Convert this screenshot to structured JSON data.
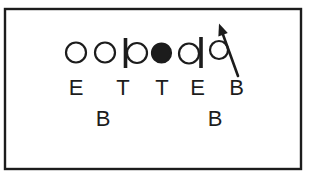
{
  "figure": {
    "kind": "football-play-diagram",
    "background_color": "#ffffff",
    "ink_color": "#1c1c1c",
    "frame": {
      "x": 5,
      "y": 9,
      "width": 296,
      "height": 160,
      "stroke_width": 2.4
    }
  },
  "formation": {
    "circle_stroke_width": 2.2,
    "offensive_line": [
      {
        "name": "lineman-1",
        "glyph": "open-circle",
        "cx": 76,
        "cy": 52.5,
        "r": 10
      },
      {
        "name": "lineman-2",
        "glyph": "open-circle",
        "cx": 105,
        "cy": 52.5,
        "r": 10
      },
      {
        "name": "lineman-3",
        "glyph": "open-circle",
        "cx": 137,
        "cy": 53,
        "r": 10,
        "bar": {
          "side": "left",
          "x": 125.5,
          "y1": 38,
          "y2": 68,
          "width": 3.6
        }
      },
      {
        "name": "center",
        "glyph": "filled-circle",
        "cx": 161.5,
        "cy": 53,
        "r": 9.5
      },
      {
        "name": "lineman-5",
        "glyph": "open-circle",
        "cx": 189,
        "cy": 53.5,
        "r": 10,
        "bar": {
          "side": "right",
          "x": 201,
          "y1": 37,
          "y2": 68,
          "width": 3.6
        }
      },
      {
        "name": "lineman-6",
        "glyph": "open-circle",
        "cx": 219,
        "cy": 50,
        "r": 9
      }
    ],
    "motion_arrow": {
      "tail_x": 238,
      "tail_y": 76,
      "tip_x": 219,
      "tip_y": 23.5,
      "stroke_width": 2.6,
      "head_length": 12,
      "head_half_width": 5
    },
    "front_labels": [
      {
        "label": "E",
        "x": 76,
        "y": 94.5
      },
      {
        "label": "T",
        "x": 123,
        "y": 95
      },
      {
        "label": "T",
        "x": 162,
        "y": 94.5
      },
      {
        "label": "E",
        "x": 197.5,
        "y": 94.5
      },
      {
        "label": "B",
        "x": 236.5,
        "y": 95
      }
    ],
    "linebacker_labels": [
      {
        "label": "B",
        "x": 103,
        "y": 125.5
      },
      {
        "label": "B",
        "x": 215,
        "y": 125.5
      }
    ],
    "label_font_size": 22
  }
}
